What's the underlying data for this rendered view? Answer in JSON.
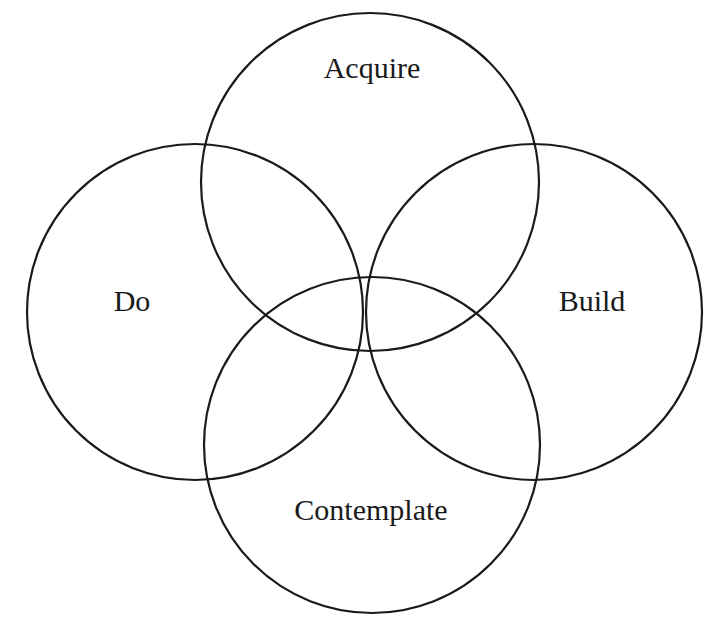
{
  "diagram": {
    "type": "four-circle overlapping venn diagram",
    "stroke_color": "#1a1a1a",
    "background": "#ffffff",
    "circles": [
      {
        "id": "acquire",
        "label": "Acquire",
        "cx": 370,
        "cy": 182,
        "r": 169,
        "label_x": 372,
        "label_y": 78
      },
      {
        "id": "do",
        "label": "Do",
        "cx": 195,
        "cy": 312,
        "r": 168,
        "label_x": 132,
        "label_y": 311
      },
      {
        "id": "build",
        "label": "Build",
        "cx": 534,
        "cy": 312,
        "r": 168,
        "label_x": 592,
        "label_y": 311
      },
      {
        "id": "contemplate",
        "label": "Contemplate",
        "cx": 372,
        "cy": 445,
        "r": 168,
        "label_x": 371,
        "label_y": 520
      }
    ]
  }
}
